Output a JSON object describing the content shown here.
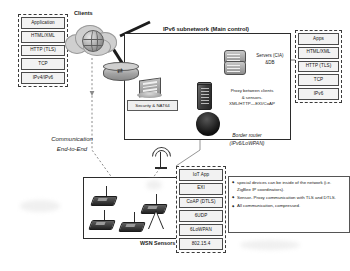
{
  "client_stack": {
    "name": "client-protocol-stack",
    "layers": [
      "Application",
      "HTML/XML",
      "HTTP (TLS)",
      "TCP",
      "IPv4/IPv6"
    ]
  },
  "apps_stack": {
    "name": "apps-protocol-stack",
    "layers": [
      "Apps",
      "HTML/XML",
      "HTTP (TLS)",
      "TCP",
      "IPv6"
    ]
  },
  "sensor_stack": {
    "name": "sensor-protocol-stack",
    "layers": [
      "IoT App",
      "EXI",
      "CoAP (DTLS)",
      "6UDP",
      "6LoWPAN",
      "802.15.4"
    ]
  },
  "clouds": {
    "clients_label": "Clients"
  },
  "main_panel": {
    "title": "IPv6 subnetwork (Main control)",
    "security_label": "Security & NAT64",
    "servers_line1": "Servers (CIA)",
    "servers_line2": "&DB",
    "proxy_line1": "Proxy between clients",
    "proxy_line2": "& sensors.",
    "proxy_line3": "XML/HTTP—EXI/CoAP"
  },
  "border_router": {
    "line1": "Border router",
    "line2": "(IPv6/LoWPAN)"
  },
  "wsn": {
    "label": "WSN Sensors"
  },
  "communication": {
    "line1": "Communication",
    "line2": "End-to-End"
  },
  "notes": {
    "items": [
      "special devices can be inside of the network (i.e. ZigBee IP coordinators).",
      "Sensor- Proxy communication with TLS and DTLS.",
      "All communication, compressed."
    ]
  },
  "colors": {
    "panel_border": "#2b2b2b",
    "stack_border": "#4a4a4a",
    "stack_fill": "#f2f2f2",
    "dark_device": "#262626",
    "cloud": "#cfcfcf"
  }
}
